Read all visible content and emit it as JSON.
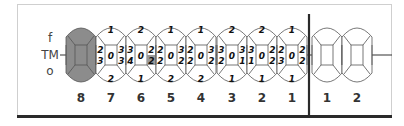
{
  "side_labels": {
    "top": "f",
    "middle": "TM",
    "bottom": "o"
  },
  "colors": {
    "missing_fill": "#8c8c8c",
    "outline": "#555555",
    "divider": "#2a2a2a",
    "highlight_fill": "#9a9a9a"
  },
  "left_quadrant": {
    "teeth": [
      {
        "number": "8",
        "missing": true
      },
      {
        "number": "7",
        "top": "1",
        "mesial_upper": "2",
        "mesial_lower": "3",
        "center": "0",
        "distal_upper": "3",
        "distal_lower": "3",
        "bottom": "2"
      },
      {
        "number": "6",
        "top": "2",
        "mesial_upper": "3",
        "mesial_lower": "4",
        "center": "0",
        "distal_upper": "2",
        "distal_lower": "2",
        "bottom": "1",
        "shaded": "mesial_lower"
      },
      {
        "number": "5",
        "top": "1",
        "mesial_upper": "2",
        "mesial_lower": "2",
        "center": "0",
        "distal_upper": "3",
        "distal_lower": "2",
        "bottom": "2"
      },
      {
        "number": "4",
        "top": "1",
        "mesial_upper": "2",
        "mesial_lower": "2",
        "center": "0",
        "distal_upper": "3",
        "distal_lower": "2",
        "bottom": "2"
      },
      {
        "number": "3",
        "top": "2",
        "mesial_upper": "3",
        "mesial_lower": "2",
        "center": "0",
        "distal_upper": "3",
        "distal_lower": "1",
        "bottom": "1"
      },
      {
        "number": "2",
        "top": "2",
        "mesial_upper": "3",
        "mesial_lower": "1",
        "center": "0",
        "distal_upper": "2",
        "distal_lower": "2",
        "bottom": "1"
      },
      {
        "number": "1",
        "top": "1",
        "mesial_upper": "2",
        "mesial_lower": "3",
        "center": "0",
        "distal_upper": "2",
        "distal_lower": "2",
        "bottom": "1"
      }
    ]
  },
  "right_quadrant": {
    "teeth": [
      {
        "number": "1",
        "empty": true
      },
      {
        "number": "2",
        "empty": true
      }
    ]
  }
}
